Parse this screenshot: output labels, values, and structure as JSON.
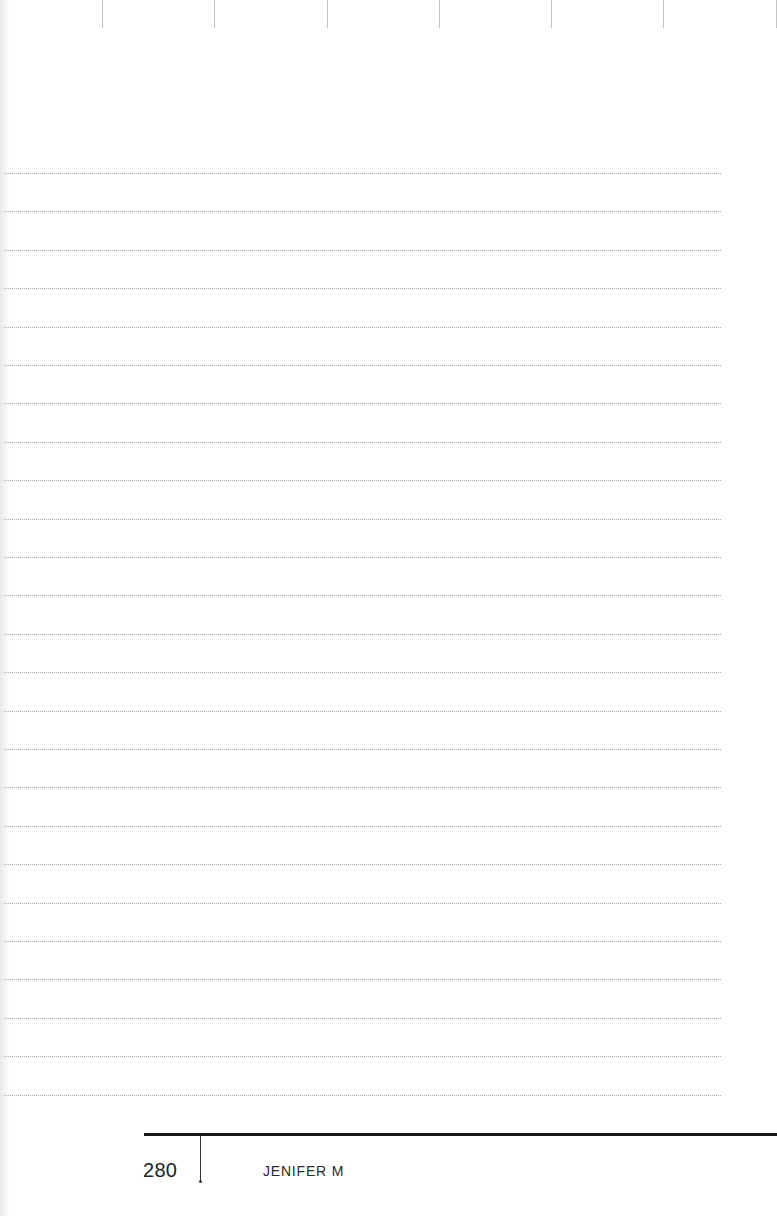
{
  "page": {
    "type": "blank-lined-notes-page",
    "background": "#ffffff"
  },
  "top_ticks": {
    "count": 7,
    "positions_x": [
      102,
      214,
      327,
      439,
      551,
      663,
      776
    ],
    "color": "#c4c4c4"
  },
  "ruled_lines": {
    "count": 25,
    "first_y": 173,
    "spacing": 38.4,
    "x_start": 4,
    "x_end": 721,
    "style": "dotted",
    "color": "#a9a9a9"
  },
  "footer": {
    "page_number": "280",
    "running_head": "JENIFER M",
    "rule_color": "#1a1a1a"
  }
}
